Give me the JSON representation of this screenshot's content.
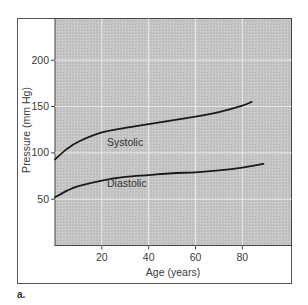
{
  "chart_data": {
    "type": "line",
    "title": "",
    "panel_label": "a.",
    "xlabel": "Age (years)",
    "ylabel": "Pressure (mm Hg)",
    "xlim": [
      0,
      101
    ],
    "ylim": [
      0,
      245
    ],
    "grid": true,
    "legend": "none (inline series labels)",
    "x_ticks": [
      20,
      40,
      60,
      80
    ],
    "x_tick_labels": [
      "20",
      "40",
      "60",
      "80"
    ],
    "y_ticks": [
      50,
      100,
      150,
      200
    ],
    "y_tick_labels": [
      "50",
      "100",
      "150",
      "200"
    ],
    "series": [
      {
        "name": "Systolic",
        "label": "Systolic",
        "x": [
          0,
          5,
          10,
          20,
          30,
          40,
          50,
          60,
          70,
          80,
          84
        ],
        "values": [
          93,
          104,
          112,
          122,
          127,
          131,
          135,
          139,
          144,
          151,
          155
        ]
      },
      {
        "name": "Diastolic",
        "label": "Diastolic",
        "x": [
          0,
          5,
          10,
          20,
          30,
          40,
          50,
          60,
          70,
          80,
          89
        ],
        "values": [
          52,
          59,
          64,
          70,
          74,
          76,
          78,
          79,
          81,
          84,
          88
        ]
      }
    ],
    "colors": {
      "plot_background": "#c4c4c4",
      "grid": "#ebebeb",
      "curve": "#1a1a1a",
      "frame": "#555555"
    }
  }
}
